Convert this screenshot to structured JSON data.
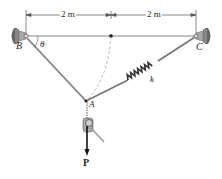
{
  "diagram": {
    "type": "statics-cable-spring-system",
    "dimensions": [
      {
        "label": "2 m",
        "from": "B",
        "to": "midpoint"
      },
      {
        "label": "2 m",
        "from": "midpoint",
        "to": "C"
      }
    ],
    "points": {
      "B": "B",
      "C": "C",
      "A": "A"
    },
    "angle_label": "θ",
    "spring_label": "k",
    "load_label": "P",
    "colors": {
      "line": "#444444",
      "cable": "#888888",
      "support": "#555555",
      "spring": "#333333"
    }
  }
}
